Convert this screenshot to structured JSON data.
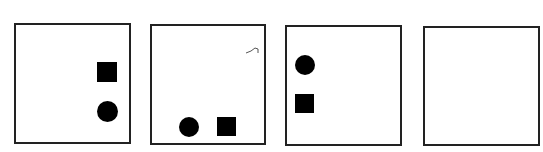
{
  "puzzle": {
    "panels": [
      {
        "index": 1,
        "shapes": [
          {
            "type": "square",
            "position": "right-middle"
          },
          {
            "type": "circle",
            "position": "right-lower"
          }
        ]
      },
      {
        "index": 2,
        "shapes": [
          {
            "type": "circle",
            "position": "bottom-left-center"
          },
          {
            "type": "square",
            "position": "bottom-right-center"
          }
        ]
      },
      {
        "index": 3,
        "shapes": [
          {
            "type": "circle",
            "position": "left-upper"
          },
          {
            "type": "square",
            "position": "left-middle"
          }
        ]
      },
      {
        "index": 4,
        "shapes": []
      }
    ],
    "colors": {
      "border": "#222222",
      "shape": "#000000",
      "background": "#ffffff"
    }
  }
}
